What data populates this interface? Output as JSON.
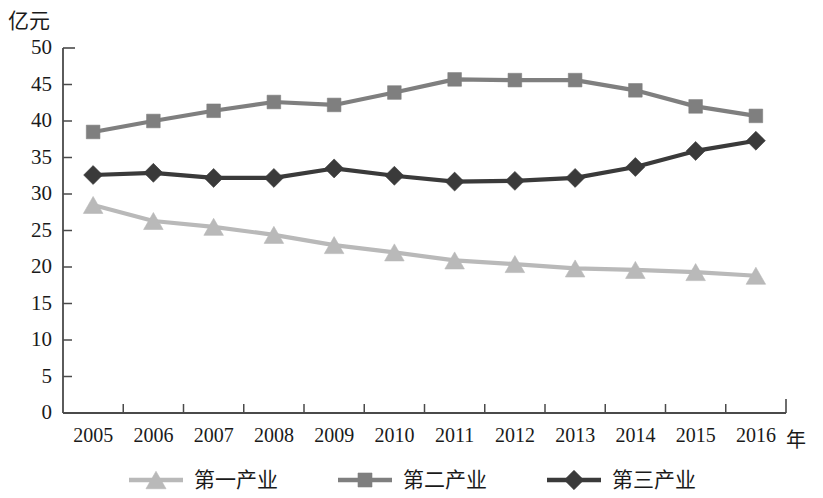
{
  "chart_data": {
    "type": "line",
    "title": "",
    "subtitle": "",
    "xlabel": "年",
    "ylabel": "亿元",
    "categories": [
      "2005",
      "2006",
      "2007",
      "2008",
      "2009",
      "2010",
      "2011",
      "2012",
      "2013",
      "2014",
      "2015",
      "2016"
    ],
    "ylim": [
      0,
      50
    ],
    "yticks": [
      "0",
      "5",
      "10",
      "15",
      "20",
      "25",
      "30",
      "35",
      "40",
      "45",
      "50"
    ],
    "ytick_values": [
      0,
      5,
      10,
      15,
      20,
      25,
      30,
      35,
      40,
      45,
      50
    ],
    "grid": false,
    "legend_position": "bottom",
    "series": [
      {
        "name": "第一产业",
        "marker": "triangle",
        "color": "#b9b9b9",
        "values": [
          28.5,
          26.3,
          25.5,
          24.4,
          23.0,
          22.0,
          20.9,
          20.4,
          19.8,
          19.6,
          19.3,
          18.8
        ]
      },
      {
        "name": "第二产业",
        "marker": "square",
        "color": "#7f7f7f",
        "values": [
          38.5,
          40.0,
          41.4,
          42.6,
          42.2,
          43.9,
          45.7,
          45.6,
          45.6,
          44.2,
          42.0,
          40.7
        ]
      },
      {
        "name": "第三产业",
        "marker": "diamond",
        "color": "#3a3a3a",
        "values": [
          32.6,
          32.9,
          32.2,
          32.2,
          33.5,
          32.5,
          31.7,
          31.8,
          32.2,
          33.7,
          35.9,
          37.3
        ]
      }
    ]
  },
  "axis": {
    "unit_y": "亿元",
    "unit_x": "年",
    "line_color": "#4a4a4a"
  },
  "legend": {
    "items": [
      {
        "label": "第一产业"
      },
      {
        "label": "第二产业"
      },
      {
        "label": "第三产业"
      }
    ]
  }
}
